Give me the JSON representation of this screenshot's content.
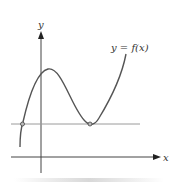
{
  "diagram": {
    "type": "function-graph",
    "axis_labels": {
      "x": "x",
      "y": "y"
    },
    "curve_label": "y = f(x)",
    "horizontal_line": "horizontal line intersecting curve at two points",
    "points": [
      {
        "name": "left-intersection",
        "description": "curve crosses horizontal line"
      },
      {
        "name": "local-minimum",
        "description": "curve touches horizontal line at local minimum"
      }
    ],
    "colors": {
      "curve": "#555555",
      "axes": "#333333",
      "horizontal_line": "#9a9a9a"
    }
  }
}
